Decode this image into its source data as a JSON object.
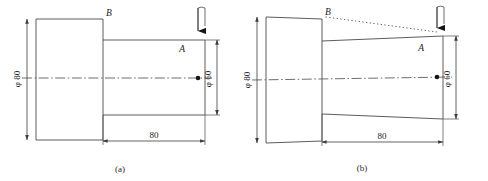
{
  "figure": {
    "type": "engineering-drawing",
    "background": "#ffffff",
    "line_color": "#4a4a4a",
    "text_color": "#1d1d1d",
    "panels": [
      {
        "id": "a",
        "caption": "(a)",
        "description": "stepped shaft, ideal cylindrical form",
        "labels": {
          "point_b": "B",
          "point_a": "A",
          "dia_large": "φ 80",
          "dia_small": "φ 60",
          "length": "80"
        },
        "force_arrow": "down-arrow-icon",
        "centerline": "dash-dot",
        "deflected": false
      },
      {
        "id": "b",
        "caption": "(b)",
        "description": "stepped shaft, deflected / tapered form with dotted reference line from B to A",
        "labels": {
          "point_b": "B",
          "point_a": "A",
          "dia_large": "φ 80",
          "dia_small": "φ 60",
          "length": "80"
        },
        "force_arrow": "down-arrow-icon",
        "centerline": "dash-dot",
        "reference_line": "dotted",
        "deflected": true
      }
    ]
  }
}
